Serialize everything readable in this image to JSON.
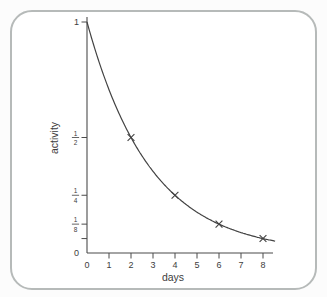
{
  "card": {
    "border_color": "#b6bab9",
    "background": "#ffffff"
  },
  "colors": {
    "curve": "#434343",
    "axis": "#4b4b4b",
    "text": "#3d3d3d",
    "page_bg": "#fcfcfc"
  },
  "chart_data": {
    "type": "line",
    "title": "",
    "xlabel": "days",
    "ylabel": "activity",
    "xlim": [
      0,
      8.5
    ],
    "ylim": [
      0,
      1
    ],
    "grid": false,
    "x_ticks": [
      0,
      1,
      2,
      3,
      4,
      5,
      6,
      7,
      8
    ],
    "y_ticks": [
      {
        "value": 1,
        "label": "1"
      },
      {
        "value": 0.5,
        "label": "1/2"
      },
      {
        "value": 0.25,
        "label": "1/4"
      },
      {
        "value": 0.125,
        "label": "1/8"
      },
      {
        "value": 0.0625,
        "label": ""
      },
      {
        "value": 0,
        "label": "0"
      }
    ],
    "curve": {
      "model": "exponential-decay",
      "initial_activity": 1,
      "half_life_days": 2,
      "x_start": 0,
      "x_end": 8.55
    },
    "points": [
      {
        "x": 2,
        "y": 0.5
      },
      {
        "x": 4,
        "y": 0.25
      },
      {
        "x": 6,
        "y": 0.125
      },
      {
        "x": 8,
        "y": 0.0625
      }
    ],
    "marker": "x"
  }
}
